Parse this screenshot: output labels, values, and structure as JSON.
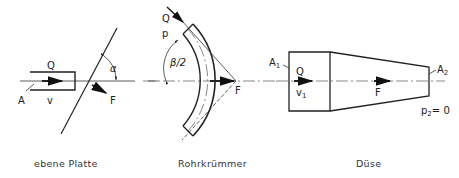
{
  "diagrams": [
    {
      "id": "plate",
      "caption": "ebene Platte",
      "labels": {
        "flow": "Q",
        "area": "A",
        "velocity": "v",
        "force": "F",
        "angle": "α"
      }
    },
    {
      "id": "bend",
      "caption": "Rohrkrümmer",
      "labels": {
        "flow": "Q",
        "pressure": "p",
        "angle": "β/2",
        "force": "F"
      }
    },
    {
      "id": "nozzle",
      "caption": "Düse",
      "labels": {
        "area_in": "A",
        "area_in_sub": "1",
        "flow": "Q",
        "velocity": "v",
        "velocity_sub": "1",
        "force": "F",
        "area_out": "A",
        "area_out_sub": "2",
        "pressure_out": "p",
        "pressure_out_sub": "2",
        "pressure_out_value": "= 0"
      }
    }
  ],
  "colors": {
    "line": "#222222",
    "background": "#ffffff"
  }
}
